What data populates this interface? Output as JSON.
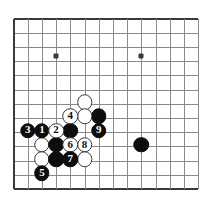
{
  "board": {
    "kind": "go-board-diagram",
    "description": "Go joseki diagram, lower-left corner, moves 1 through 9",
    "columns": 14,
    "rows": 13,
    "origin_x": 13.5,
    "origin_y": 18.5,
    "spacing": 14.2,
    "grid_color": "#8a8a8a",
    "edge_color": "#3a3a3a",
    "background": "#ffffff",
    "black_color": "#0d0d0d",
    "white_color": "#ffffff",
    "star_points": [
      {
        "col": 3,
        "row": 2.65
      },
      {
        "col": 9,
        "row": 2.65
      }
    ],
    "stones": [
      {
        "col": 5,
        "row": 5.9,
        "color": "white",
        "label": "",
        "name": "stone-white-a"
      },
      {
        "col": 6,
        "row": 6.9,
        "color": "black",
        "label": "",
        "name": "stone-black-a"
      },
      {
        "col": 4,
        "row": 6.9,
        "color": "white",
        "label": "4",
        "name": "stone-white-4"
      },
      {
        "col": 5,
        "row": 6.9,
        "color": "white",
        "label": "",
        "name": "stone-white-b"
      },
      {
        "col": 1,
        "row": 7.9,
        "color": "black",
        "label": "3",
        "name": "stone-black-3"
      },
      {
        "col": 2,
        "row": 7.9,
        "color": "black",
        "label": "1",
        "name": "stone-black-1"
      },
      {
        "col": 3,
        "row": 7.9,
        "color": "white",
        "label": "2",
        "name": "stone-white-2"
      },
      {
        "col": 4,
        "row": 7.9,
        "color": "black",
        "label": "",
        "name": "stone-black-b"
      },
      {
        "col": 6,
        "row": 7.9,
        "color": "black",
        "label": "9",
        "name": "stone-black-9"
      },
      {
        "col": 2,
        "row": 8.9,
        "color": "white",
        "label": "",
        "name": "stone-white-c"
      },
      {
        "col": 3,
        "row": 8.9,
        "color": "black",
        "label": "",
        "name": "stone-black-c"
      },
      {
        "col": 4,
        "row": 8.9,
        "color": "white",
        "label": "6",
        "name": "stone-white-6"
      },
      {
        "col": 5,
        "row": 8.9,
        "color": "white",
        "label": "8",
        "name": "stone-white-8"
      },
      {
        "col": 2,
        "row": 9.9,
        "color": "white",
        "label": "",
        "name": "stone-white-d"
      },
      {
        "col": 3,
        "row": 9.9,
        "color": "black",
        "label": "",
        "name": "stone-black-d"
      },
      {
        "col": 4,
        "row": 9.9,
        "color": "black",
        "label": "7",
        "name": "stone-black-7"
      },
      {
        "col": 5,
        "row": 9.9,
        "color": "white",
        "label": "",
        "name": "stone-white-e"
      },
      {
        "col": 2,
        "row": 10.9,
        "color": "black",
        "label": "5",
        "name": "stone-black-5"
      },
      {
        "col": 9,
        "row": 8.9,
        "color": "black",
        "label": "",
        "name": "stone-black-e"
      }
    ]
  }
}
